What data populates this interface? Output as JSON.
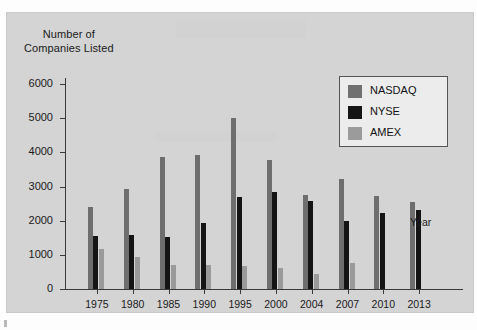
{
  "chart_data": {
    "type": "bar",
    "title": "",
    "ylabel": "Number of\nCompanies Listed",
    "ylabel_line1": "Number of",
    "ylabel_line2": "Companies Listed",
    "xlabel": "Year",
    "ylim": [
      0,
      6000
    ],
    "ytick_values": [
      0,
      1000,
      2000,
      3000,
      4000,
      5000,
      6000
    ],
    "ytick_labels": [
      "0",
      "1000",
      "2000",
      "3000",
      "4000",
      "5000",
      "6000"
    ],
    "grid": false,
    "legend_position": "top-right",
    "categories": [
      "1975",
      "1980",
      "1985",
      "1990",
      "1995",
      "2000",
      "2004",
      "2007",
      "2010",
      "2013"
    ],
    "series": [
      {
        "name": "NASDAQ",
        "color": "#6e6e6e",
        "values": [
          2400,
          2930,
          3850,
          3920,
          5000,
          3780,
          2740,
          3230,
          2720,
          2550
        ]
      },
      {
        "name": "NYSE",
        "color": "#141414",
        "values": [
          1550,
          1570,
          1530,
          1930,
          2700,
          2830,
          2580,
          1980,
          2220,
          2320
        ]
      },
      {
        "name": "AMEX",
        "color": "#9a9a9a",
        "values": [
          1175,
          930,
          715,
          700,
          665,
          615,
          450,
          750,
          null,
          null
        ]
      }
    ]
  },
  "legend": {
    "entries": [
      {
        "label": "NASDAQ",
        "swatch": "s-nasdaq"
      },
      {
        "label": "NYSE",
        "swatch": "s-nyse"
      },
      {
        "label": "AMEX",
        "swatch": "s-amex"
      }
    ]
  }
}
